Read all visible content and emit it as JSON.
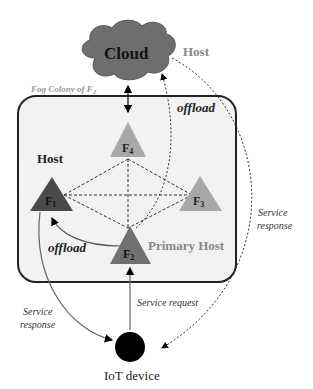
{
  "diagram": {
    "cloud": {
      "label": "Cloud",
      "host_label": "Host",
      "color": "#6e6e6e"
    },
    "colony": {
      "label": "Fog Colony of F",
      "label_sub": "2"
    },
    "nodes": [
      {
        "id": "F1",
        "label": "F",
        "sub": "1",
        "role": "Host",
        "color": "#4a4a4a"
      },
      {
        "id": "F2",
        "label": "F",
        "sub": "2",
        "role": "Primary Host",
        "color": "#707070"
      },
      {
        "id": "F3",
        "label": "F",
        "sub": "3",
        "role": "",
        "color": "#a8a8a8"
      },
      {
        "id": "F4",
        "label": "F",
        "sub": "4",
        "role": "",
        "color": "#a8a8a8"
      }
    ],
    "edges": {
      "offload_cloud": "offload",
      "offload_f1": "offload",
      "service_request": "Service request",
      "service_response_left_1": "Service",
      "service_response_left_2": "response",
      "service_response_right_1": "Service",
      "service_response_right_2": "response"
    },
    "iot": {
      "label": "IoT device"
    }
  }
}
